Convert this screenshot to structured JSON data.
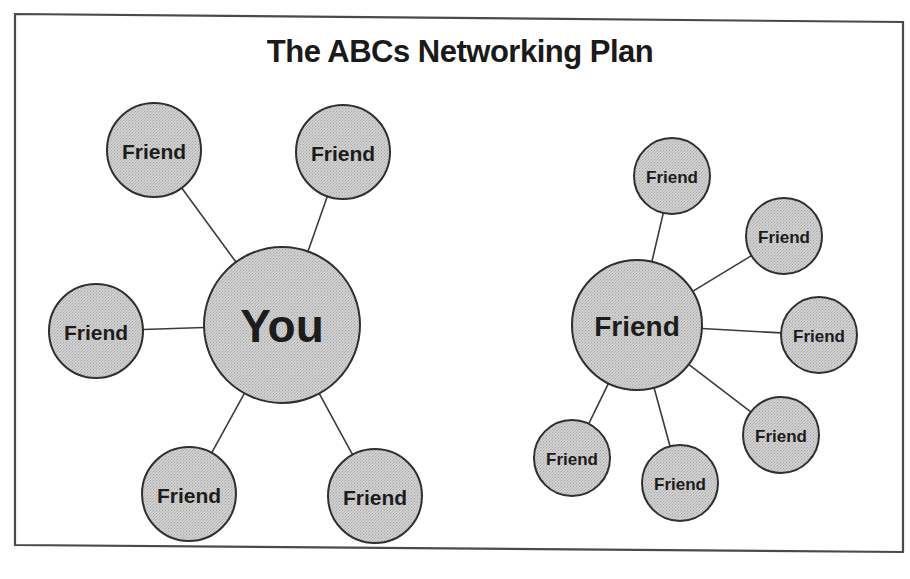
{
  "title": "The ABCs Networking Plan",
  "colors": {
    "node_fill": "#c8c8c8",
    "node_stroke": "#2f2f2f",
    "line": "#3c3c3c",
    "frame": "#4a4a4a",
    "text": "#1c1c1c",
    "background": "#ffffff"
  },
  "clusters": [
    {
      "name": "you-cluster",
      "center": {
        "label": "You",
        "cx": 282,
        "cy": 325,
        "r": 78,
        "font_size": 46
      },
      "nodes": [
        {
          "label": "Friend",
          "cx": 154,
          "cy": 150,
          "r": 47,
          "font_size": 21
        },
        {
          "label": "Friend",
          "cx": 343,
          "cy": 152,
          "r": 47,
          "font_size": 21
        },
        {
          "label": "Friend",
          "cx": 96,
          "cy": 331,
          "r": 47,
          "font_size": 21
        },
        {
          "label": "Friend",
          "cx": 189,
          "cy": 494,
          "r": 47,
          "font_size": 21
        },
        {
          "label": "Friend",
          "cx": 375,
          "cy": 496,
          "r": 47,
          "font_size": 21
        }
      ]
    },
    {
      "name": "friend-cluster",
      "center": {
        "label": "Friend",
        "cx": 637,
        "cy": 325,
        "r": 65,
        "font_size": 28
      },
      "nodes": [
        {
          "label": "Friend",
          "cx": 672,
          "cy": 176,
          "r": 38,
          "font_size": 17
        },
        {
          "label": "Friend",
          "cx": 784,
          "cy": 236,
          "r": 38,
          "font_size": 17
        },
        {
          "label": "Friend",
          "cx": 819,
          "cy": 335,
          "r": 38,
          "font_size": 17
        },
        {
          "label": "Friend",
          "cx": 781,
          "cy": 435,
          "r": 38,
          "font_size": 17
        },
        {
          "label": "Friend",
          "cx": 680,
          "cy": 483,
          "r": 38,
          "font_size": 17
        },
        {
          "label": "Friend",
          "cx": 572,
          "cy": 458,
          "r": 38,
          "font_size": 17
        }
      ]
    }
  ]
}
